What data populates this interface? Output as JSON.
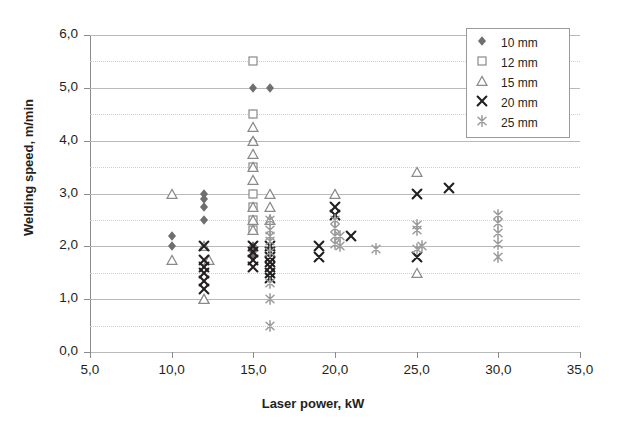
{
  "chart_data": {
    "type": "scatter",
    "title": "",
    "xlabel": "Laser power, kW",
    "ylabel": "Welding speed, m/min",
    "xlim": [
      5.0,
      35.0
    ],
    "ylim": [
      0.0,
      6.0
    ],
    "xticks": [
      "5,0",
      "10,0",
      "15,0",
      "20,0",
      "25,0",
      "30,0",
      "35,0"
    ],
    "xtick_values": [
      5,
      10,
      15,
      20,
      25,
      30,
      35
    ],
    "yticks": [
      "0,0",
      "1,0",
      "2,0",
      "3,0",
      "4,0",
      "5,0",
      "6,0"
    ],
    "ytick_values": [
      0,
      1,
      2,
      3,
      4,
      5,
      6
    ],
    "grid": "horizontal major and minor (0.5 steps)",
    "legend_position": "top-right inside plot",
    "series": [
      {
        "name": "10 mm",
        "marker": "filled-diamond",
        "color": "#6f6f6f",
        "points": [
          [
            10.0,
            2.2
          ],
          [
            10.0,
            2.0
          ],
          [
            12.0,
            3.0
          ],
          [
            12.0,
            2.9
          ],
          [
            12.0,
            2.75
          ],
          [
            12.0,
            2.5
          ],
          [
            15.0,
            5.0
          ],
          [
            16.0,
            5.0
          ],
          [
            15.0,
            4.5
          ],
          [
            15.0,
            4.0
          ],
          [
            15.0,
            3.0
          ],
          [
            15.0,
            2.5
          ],
          [
            15.0,
            2.0
          ],
          [
            15.0,
            1.9
          ],
          [
            15.0,
            1.8
          ]
        ]
      },
      {
        "name": "12 mm",
        "marker": "open-square",
        "color": "#8a8a8a",
        "points": [
          [
            15.0,
            5.5
          ],
          [
            15.0,
            4.5
          ],
          [
            15.0,
            3.5
          ],
          [
            15.0,
            3.0
          ],
          [
            15.0,
            2.75
          ],
          [
            15.0,
            2.5
          ],
          [
            15.0,
            2.3
          ]
        ]
      },
      {
        "name": "15 mm",
        "marker": "open-triangle",
        "color": "#8a8a8a",
        "points": [
          [
            10.0,
            3.0
          ],
          [
            10.0,
            1.75
          ],
          [
            12.0,
            2.0
          ],
          [
            12.3,
            1.75
          ],
          [
            12.0,
            1.0
          ],
          [
            15.0,
            4.25
          ],
          [
            15.0,
            4.0
          ],
          [
            15.0,
            3.75
          ],
          [
            15.0,
            3.5
          ],
          [
            15.0,
            3.25
          ],
          [
            15.0,
            2.75
          ],
          [
            15.0,
            2.5
          ],
          [
            15.0,
            2.3
          ],
          [
            16.0,
            3.0
          ],
          [
            16.0,
            2.75
          ],
          [
            16.0,
            2.5
          ],
          [
            12.0,
            1.0
          ],
          [
            20.0,
            3.0
          ],
          [
            25.0,
            3.4
          ],
          [
            25.0,
            1.5
          ]
        ]
      },
      {
        "name": "20 mm",
        "marker": "cross-x",
        "color": "#231f20",
        "points": [
          [
            12.0,
            2.0
          ],
          [
            12.0,
            1.75
          ],
          [
            12.0,
            1.6
          ],
          [
            12.0,
            1.5
          ],
          [
            12.0,
            1.35
          ],
          [
            12.0,
            1.2
          ],
          [
            15.0,
            2.0
          ],
          [
            15.0,
            1.9
          ],
          [
            15.0,
            1.75
          ],
          [
            15.0,
            1.6
          ],
          [
            16.0,
            2.0
          ],
          [
            16.0,
            1.9
          ],
          [
            16.0,
            1.8
          ],
          [
            16.0,
            1.7
          ],
          [
            16.0,
            1.6
          ],
          [
            16.0,
            1.5
          ],
          [
            16.0,
            1.4
          ],
          [
            19.0,
            2.0
          ],
          [
            19.0,
            1.8
          ],
          [
            20.0,
            2.75
          ],
          [
            20.0,
            2.6
          ],
          [
            21.0,
            2.2
          ],
          [
            25.0,
            3.0
          ],
          [
            27.0,
            3.1
          ],
          [
            25.0,
            1.8
          ]
        ]
      },
      {
        "name": "25 mm",
        "marker": "asterisk",
        "color": "#9a9a9a",
        "points": [
          [
            16.0,
            2.5
          ],
          [
            16.0,
            2.3
          ],
          [
            16.0,
            2.2
          ],
          [
            16.0,
            2.1
          ],
          [
            16.0,
            1.9
          ],
          [
            16.0,
            1.3
          ],
          [
            16.0,
            1.0
          ],
          [
            16.0,
            0.5
          ],
          [
            20.0,
            2.5
          ],
          [
            20.0,
            2.35
          ],
          [
            20.0,
            2.2
          ],
          [
            20.0,
            2.05
          ],
          [
            20.3,
            2.2
          ],
          [
            20.3,
            2.0
          ],
          [
            22.5,
            1.95
          ],
          [
            25.0,
            2.4
          ],
          [
            25.0,
            2.3
          ],
          [
            25.3,
            2.0
          ],
          [
            25.0,
            1.95
          ],
          [
            30.0,
            2.6
          ],
          [
            30.0,
            2.45
          ],
          [
            30.0,
            2.25
          ],
          [
            30.0,
            2.05
          ],
          [
            30.0,
            1.8
          ]
        ]
      }
    ]
  },
  "legend": {
    "items": [
      {
        "label": "10 mm",
        "marker": "filled-diamond"
      },
      {
        "label": "12 mm",
        "marker": "open-square"
      },
      {
        "label": "15 mm",
        "marker": "open-triangle"
      },
      {
        "label": "20 mm",
        "marker": "cross-x"
      },
      {
        "label": "25 mm",
        "marker": "asterisk"
      }
    ]
  },
  "colors": {
    "diamond": "#6f6f6f",
    "square": "#8a8a8a",
    "triangle": "#8a8a8a",
    "cross": "#231f20",
    "asterisk": "#9a9a9a",
    "grid_major": "#b9b9b9",
    "grid_minor": "#cfcfcf",
    "axis": "#8a8a8a",
    "text": "#231f20"
  }
}
